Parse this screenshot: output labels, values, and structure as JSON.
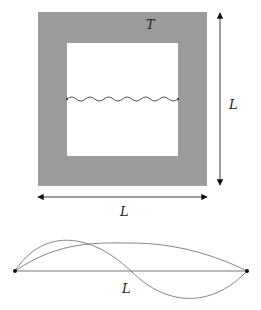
{
  "figure": {
    "box": {
      "wall_label": "T",
      "wall_color": "#9b9b9b",
      "outer": {
        "x": 38,
        "y": 12,
        "w": 169,
        "h": 174
      },
      "inner": {
        "x": 67,
        "y": 43,
        "w": 111,
        "h": 113
      },
      "spring_y": 99
    },
    "dimension_vertical": {
      "label": "L"
    },
    "dimension_horizontal": {
      "label": "L"
    },
    "string": {
      "label": "L",
      "modes": [
        "fundamental",
        "second harmonic"
      ]
    }
  }
}
